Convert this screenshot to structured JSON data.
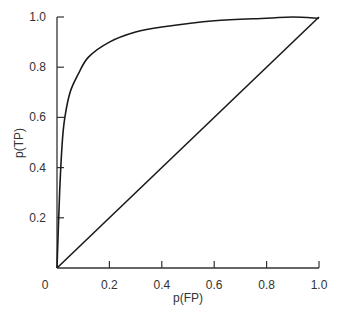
{
  "chart_data": {
    "type": "line",
    "title": "",
    "xlabel": "p(FP)",
    "ylabel": "p(TP)",
    "xlim": [
      0,
      1.0
    ],
    "ylim": [
      0,
      1.0
    ],
    "grid": false,
    "legend": null,
    "x_ticks": [
      "0",
      "0.2",
      "0.4",
      "0.6",
      "0.8",
      "1.0"
    ],
    "y_ticks": [
      "0.2",
      "0.4",
      "0.6",
      "0.8",
      "1.0"
    ],
    "series": [
      {
        "name": "ROC curve",
        "x": [
          0,
          0.01,
          0.02,
          0.03,
          0.05,
          0.08,
          0.12,
          0.2,
          0.3,
          0.4,
          0.6,
          0.8,
          0.9,
          1.0
        ],
        "y": [
          0,
          0.3,
          0.5,
          0.6,
          0.7,
          0.77,
          0.84,
          0.9,
          0.94,
          0.96,
          0.985,
          0.995,
          1.0,
          0.995
        ]
      },
      {
        "name": "Chance diagonal",
        "x": [
          0,
          1.0
        ],
        "y": [
          0,
          1.0
        ]
      }
    ]
  },
  "colors": {
    "line": "#1a1a1a",
    "axis": "#333333",
    "text": "#333333"
  }
}
